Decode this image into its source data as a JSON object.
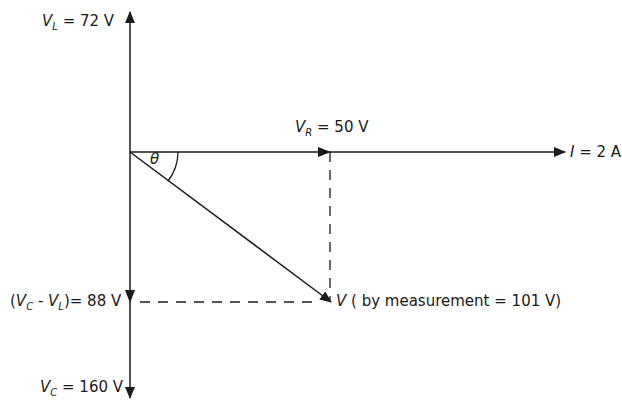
{
  "diagram": {
    "labels": {
      "vl": {
        "symbol": "V",
        "sub": "L",
        "value": "= 72 V"
      },
      "vr": {
        "symbol": "V",
        "sub": "R",
        "value": "= 50 V"
      },
      "current": {
        "symbol": "I",
        "value": "= 2 A"
      },
      "theta": "θ",
      "vc_minus_vl": {
        "open": "(",
        "symbol1": "V",
        "sub1": "C",
        "minus": " - ",
        "symbol2": "V",
        "sub2": "L",
        "close": ")",
        "value": "= 88 V"
      },
      "v": {
        "symbol": "V",
        "value": "( by measurement = 101 V)"
      },
      "vc": {
        "symbol": "V",
        "sub": "C",
        "value": "= 160 V"
      }
    },
    "colors": {
      "line": "#1a1a1a",
      "background": "#ffffff"
    }
  }
}
